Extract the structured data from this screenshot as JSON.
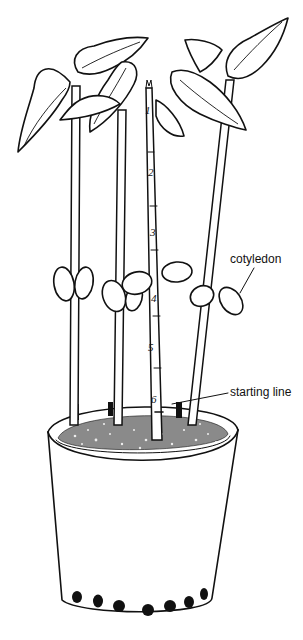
{
  "figure": {
    "labels": {
      "cotyledon": "cotyledon",
      "starting_line": "starting line"
    },
    "ruler": {
      "marks": [
        "1",
        "2",
        "3",
        "4",
        "5",
        "6"
      ]
    },
    "pot": {
      "drain_holes": 7
    },
    "colors": {
      "ink": "#111111",
      "background": "#ffffff"
    }
  }
}
